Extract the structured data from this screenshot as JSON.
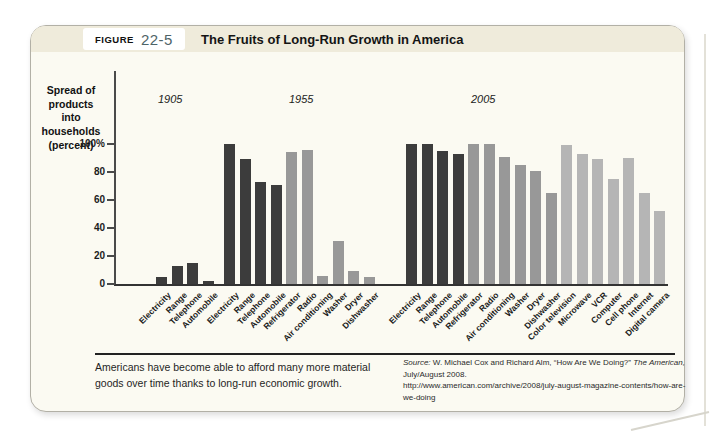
{
  "figure": {
    "label": "FIGURE",
    "number": "22-5",
    "title": "The Fruits of Long-Run Growth in America"
  },
  "chart_data": {
    "type": "bar",
    "title": "The Fruits of Long-Run Growth in America",
    "ylabel": "Spread of products into households (percent)",
    "ylabel_lines": [
      "Spread of",
      "products into",
      "households",
      "(percent)"
    ],
    "ylim": [
      0,
      100
    ],
    "ytick_values": [
      0,
      20,
      40,
      60,
      80,
      100
    ],
    "ytick_labels": [
      "0",
      "20",
      "40",
      "60",
      "80",
      "100%"
    ],
    "grid": false,
    "legend": null,
    "bar_colors_by_era": {
      "1905": "#3c3c3c",
      "1955": "#989898",
      "2005": "#b5b5b5"
    },
    "groups": [
      {
        "year_label": "1905",
        "categories": [
          "Electricity",
          "Range",
          "Telephone",
          "Automobile"
        ],
        "values": [
          5,
          13,
          15,
          2
        ],
        "eras": [
          "1905",
          "1905",
          "1905",
          "1905"
        ]
      },
      {
        "year_label": "1955",
        "categories": [
          "Electricity",
          "Range",
          "Telephone",
          "Automobile",
          "Refrigerator",
          "Radio",
          "Air conditioning",
          "Washer",
          "Dryer",
          "Dishwasher"
        ],
        "values": [
          100,
          89,
          73,
          71,
          94,
          96,
          6,
          31,
          9,
          5
        ],
        "eras": [
          "1905",
          "1905",
          "1905",
          "1905",
          "1955",
          "1955",
          "1955",
          "1955",
          "1955",
          "1955"
        ]
      },
      {
        "year_label": "2005",
        "categories": [
          "Electricity",
          "Range",
          "Telephone",
          "Automobile",
          "Refrigerator",
          "Radio",
          "Air conditioning",
          "Washer",
          "Dryer",
          "Dishwasher",
          "Color television",
          "Microwave",
          "VCR",
          "Computer",
          "Cell phone",
          "Internet",
          "Digital camera"
        ],
        "values": [
          100,
          100,
          95,
          93,
          100,
          100,
          91,
          85,
          81,
          65,
          99,
          93,
          89,
          75,
          90,
          65,
          52
        ],
        "eras": [
          "1905",
          "1905",
          "1905",
          "1905",
          "1955",
          "1955",
          "1955",
          "1955",
          "1955",
          "1955",
          "2005",
          "2005",
          "2005",
          "2005",
          "2005",
          "2005",
          "2005"
        ]
      }
    ]
  },
  "caption": "Americans have become able to afford many more material goods over time thanks to long-run economic growth.",
  "source": {
    "label": "Source:",
    "text_1": " W. Michael Cox and Richard Alm, “How Are We Doing?” ",
    "text_italic": "The American,",
    "text_2": " July/August 2008.",
    "url": "http://www.american.com/archive/2008/july-august-magazine-contents/how-are-we-doing"
  }
}
